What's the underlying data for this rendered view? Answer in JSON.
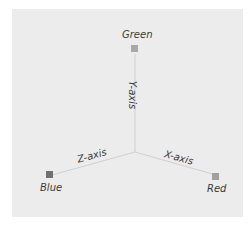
{
  "diagram": {
    "type": "3d-axes",
    "background": "#ececec",
    "axes": [
      {
        "name": "X-axis",
        "label": "X-axis",
        "direction": "lower-right"
      },
      {
        "name": "Y-axis",
        "label": "Y-axis",
        "direction": "up"
      },
      {
        "name": "Z-axis",
        "label": "Z-axis",
        "direction": "lower-left"
      }
    ],
    "endpoints": [
      {
        "label": "Green",
        "axis": "Y",
        "color": "#9e9e9e"
      },
      {
        "label": "Red",
        "axis": "X",
        "color": "#9a9a9a"
      },
      {
        "label": "Blue",
        "axis": "Z",
        "color": "#6e6e6e"
      }
    ]
  }
}
